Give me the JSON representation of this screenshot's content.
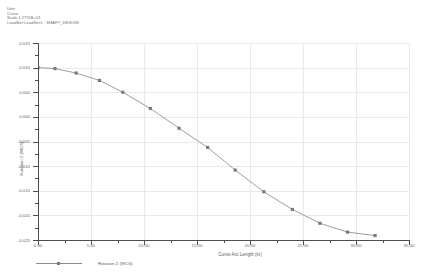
{
  "header": {
    "lines": [
      "Unit:",
      "Curve",
      "Scale 1.2770E+01",
      "LoadSet:LoadSet1 : SHAFT_DESIGN"
    ]
  },
  "chart_data": {
    "type": "line",
    "title": "",
    "xlabel": "Curve Arc Length (in)",
    "ylabel": "Rotation Z (WCS)",
    "xlim": [
      0,
      35
    ],
    "ylim": [
      -0.025,
      0.015
    ],
    "grid": true,
    "legend_position": "bottom-left",
    "xticks": [
      "0.00",
      "5.00",
      "10.00",
      "15.00",
      "20.00",
      "25.00",
      "30.00",
      "35.00"
    ],
    "xtick_values": [
      0,
      5,
      10,
      15,
      20,
      25,
      30,
      35
    ],
    "yticks": [
      "0.015",
      "0.010",
      "0.005",
      "0.000",
      "-0.005",
      "-0.010",
      "-0.015",
      "-0.020",
      "-0.025"
    ],
    "ytick_values": [
      0.015,
      0.01,
      0.005,
      0,
      -0.005,
      -0.01,
      -0.015,
      -0.02,
      -0.025
    ],
    "series": [
      {
        "name": "Rotation Z (WCS)",
        "color": "#8c8c8c",
        "marker": "square",
        "x": [
          0.0,
          1.6,
          3.6,
          5.8,
          8.0,
          10.6,
          13.3,
          16.0,
          18.6,
          21.3,
          24.0,
          26.6,
          29.2,
          31.8
        ],
        "y": [
          0.01,
          0.0098,
          0.0089,
          0.0074,
          0.005,
          0.0017,
          -0.0023,
          -0.0062,
          -0.0108,
          -0.0152,
          -0.0188,
          -0.0216,
          -0.0234,
          -0.0241
        ]
      }
    ]
  },
  "legend": {
    "entry_label": "Rotation Z (WCS)"
  }
}
